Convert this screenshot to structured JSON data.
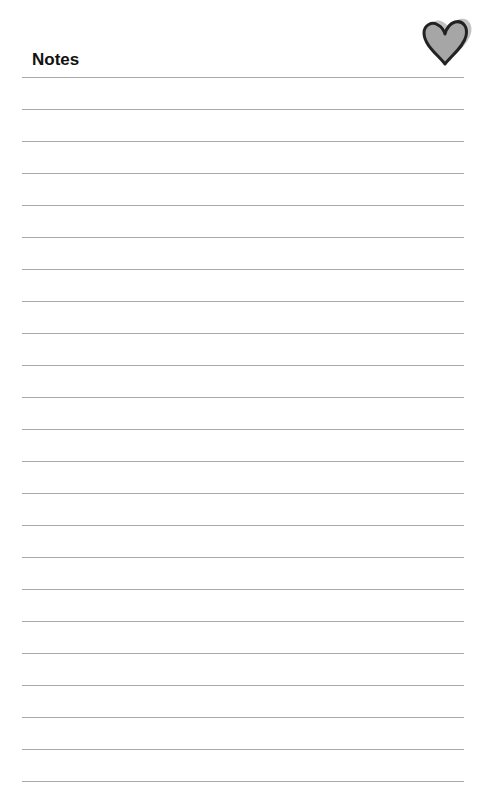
{
  "header": {
    "title": "Notes",
    "icon": "heart-icon"
  },
  "lines": {
    "count": 23,
    "first_y": 77,
    "spacing": 32,
    "color": "#a8a8a8"
  },
  "colors": {
    "heart_fill": "#a6a6a6",
    "heart_stroke": "#222222",
    "heart_shadow": "#9a9a9a"
  }
}
